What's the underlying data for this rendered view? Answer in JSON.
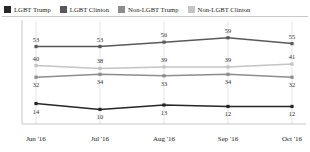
{
  "legend": {
    "items": [
      {
        "label": "LGBT Trump",
        "color": "#262626"
      },
      {
        "label": "LGBT Clinton",
        "color": "#59595b"
      },
      {
        "label": "Non-LGBT Trump",
        "color": "#8d8d8f"
      },
      {
        "label": "Non-LGBT Clinton",
        "color": "#c4c4c6"
      }
    ]
  },
  "axis": {
    "categories": [
      "Jun '16",
      "Jul '16",
      "Aug '16",
      "Sep '16",
      "Oct '16"
    ]
  },
  "chart_data": {
    "type": "line",
    "title": "",
    "subtitle": "",
    "xlabel": "",
    "ylabel": "",
    "categories": [
      "Jun '16",
      "Jul '16",
      "Aug '16",
      "Sep '16",
      "Oct '16"
    ],
    "ylim": [
      0,
      65
    ],
    "grid": "vertical-only",
    "legend_position": "top-left",
    "series": [
      {
        "name": "LGBT Trump",
        "color": "#262626",
        "values": [
          14,
          10,
          13,
          12,
          12
        ],
        "label_position": "below"
      },
      {
        "name": "LGBT Clinton",
        "color": "#59595b",
        "values": [
          53,
          53,
          56,
          59,
          55
        ],
        "label_position": "above"
      },
      {
        "name": "Non-LGBT Trump",
        "color": "#8d8d8f",
        "values": [
          32,
          34,
          33,
          34,
          32
        ],
        "label_position": "below"
      },
      {
        "name": "Non-LGBT Clinton",
        "color": "#c4c4c6",
        "values": [
          40,
          38,
          39,
          39,
          41
        ],
        "label_position": "above"
      }
    ]
  }
}
